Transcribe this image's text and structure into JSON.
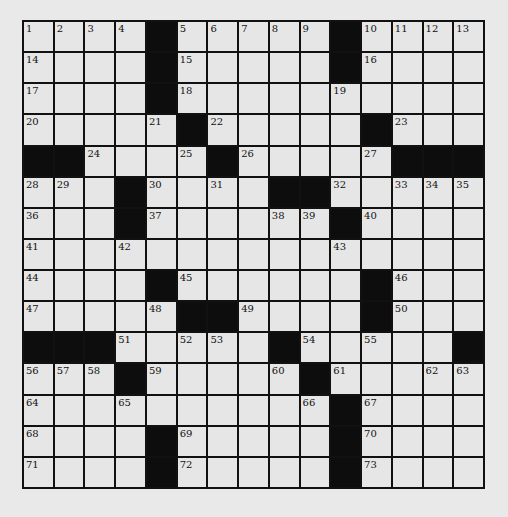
{
  "puzzle": {
    "rows": 15,
    "cols": 15,
    "colors": {
      "background": "#e9e9e9",
      "cell_fill": "#e6e6e6",
      "block_fill": "#0d0d0d",
      "grid_line": "#111111"
    },
    "layout": [
      "....#.....#....",
      "....#.....#....",
      "....#..........",
      ".....#.....#...",
      "##....#.....###",
      "...#....##.....",
      "...#......#....",
      "...............",
      "....#......#...",
      ".....##....#...",
      "###.....#.....##",
      "...#.....#.....",
      "..........#....",
      "....#.....#....",
      "....#.....#...."
    ],
    "numbers": [
      {
        "r": 0,
        "c": 0,
        "n": 1
      },
      {
        "r": 0,
        "c": 1,
        "n": 2
      },
      {
        "r": 0,
        "c": 2,
        "n": 3
      },
      {
        "r": 0,
        "c": 3,
        "n": 4
      },
      {
        "r": 0,
        "c": 5,
        "n": 5
      },
      {
        "r": 0,
        "c": 6,
        "n": 6
      },
      {
        "r": 0,
        "c": 7,
        "n": 7
      },
      {
        "r": 0,
        "c": 8,
        "n": 8
      },
      {
        "r": 0,
        "c": 9,
        "n": 9
      },
      {
        "r": 0,
        "c": 11,
        "n": 10
      },
      {
        "r": 0,
        "c": 12,
        "n": 11
      },
      {
        "r": 0,
        "c": 13,
        "n": 12
      },
      {
        "r": 0,
        "c": 14,
        "n": 13
      },
      {
        "r": 1,
        "c": 0,
        "n": 14
      },
      {
        "r": 1,
        "c": 5,
        "n": 15
      },
      {
        "r": 1,
        "c": 11,
        "n": 16
      },
      {
        "r": 2,
        "c": 0,
        "n": 17
      },
      {
        "r": 2,
        "c": 5,
        "n": 18
      },
      {
        "r": 2,
        "c": 10,
        "n": 19
      },
      {
        "r": 3,
        "c": 0,
        "n": 20
      },
      {
        "r": 3,
        "c": 4,
        "n": 21
      },
      {
        "r": 3,
        "c": 6,
        "n": 22
      },
      {
        "r": 3,
        "c": 12,
        "n": 23
      },
      {
        "r": 4,
        "c": 2,
        "n": 24
      },
      {
        "r": 4,
        "c": 5,
        "n": 25
      },
      {
        "r": 4,
        "c": 7,
        "n": 26
      },
      {
        "r": 4,
        "c": 11,
        "n": 27
      },
      {
        "r": 5,
        "c": 0,
        "n": 28
      },
      {
        "r": 5,
        "c": 1,
        "n": 29
      },
      {
        "r": 5,
        "c": 4,
        "n": 30
      },
      {
        "r": 5,
        "c": 6,
        "n": 31
      },
      {
        "r": 5,
        "c": 10,
        "n": 32
      },
      {
        "r": 5,
        "c": 12,
        "n": 33
      },
      {
        "r": 5,
        "c": 13,
        "n": 34
      },
      {
        "r": 5,
        "c": 14,
        "n": 35
      },
      {
        "r": 6,
        "c": 0,
        "n": 36
      },
      {
        "r": 6,
        "c": 4,
        "n": 37
      },
      {
        "r": 6,
        "c": 8,
        "n": 38
      },
      {
        "r": 6,
        "c": 9,
        "n": 39
      },
      {
        "r": 6,
        "c": 11,
        "n": 40
      },
      {
        "r": 7,
        "c": 0,
        "n": 41
      },
      {
        "r": 7,
        "c": 3,
        "n": 42
      },
      {
        "r": 7,
        "c": 10,
        "n": 43
      },
      {
        "r": 8,
        "c": 0,
        "n": 44
      },
      {
        "r": 8,
        "c": 5,
        "n": 45
      },
      {
        "r": 8,
        "c": 12,
        "n": 46
      },
      {
        "r": 9,
        "c": 0,
        "n": 47
      },
      {
        "r": 9,
        "c": 4,
        "n": 48
      },
      {
        "r": 9,
        "c": 7,
        "n": 49
      },
      {
        "r": 9,
        "c": 12,
        "n": 50
      },
      {
        "r": 10,
        "c": 3,
        "n": 51
      },
      {
        "r": 10,
        "c": 5,
        "n": 52
      },
      {
        "r": 10,
        "c": 6,
        "n": 53
      },
      {
        "r": 10,
        "c": 9,
        "n": 54
      },
      {
        "r": 10,
        "c": 11,
        "n": 55
      },
      {
        "r": 11,
        "c": 0,
        "n": 56
      },
      {
        "r": 11,
        "c": 1,
        "n": 57
      },
      {
        "r": 11,
        "c": 2,
        "n": 58
      },
      {
        "r": 11,
        "c": 4,
        "n": 59
      },
      {
        "r": 11,
        "c": 8,
        "n": 60
      },
      {
        "r": 11,
        "c": 10,
        "n": 61
      },
      {
        "r": 11,
        "c": 13,
        "n": 62
      },
      {
        "r": 11,
        "c": 14,
        "n": 63
      },
      {
        "r": 12,
        "c": 0,
        "n": 64
      },
      {
        "r": 12,
        "c": 3,
        "n": 65
      },
      {
        "r": 12,
        "c": 9,
        "n": 66
      },
      {
        "r": 12,
        "c": 11,
        "n": 67
      },
      {
        "r": 13,
        "c": 0,
        "n": 68
      },
      {
        "r": 13,
        "c": 5,
        "n": 69
      },
      {
        "r": 13,
        "c": 11,
        "n": 70
      },
      {
        "r": 14,
        "c": 0,
        "n": 71
      },
      {
        "r": 14,
        "c": 5,
        "n": 72
      },
      {
        "r": 14,
        "c": 11,
        "n": 73
      }
    ]
  }
}
